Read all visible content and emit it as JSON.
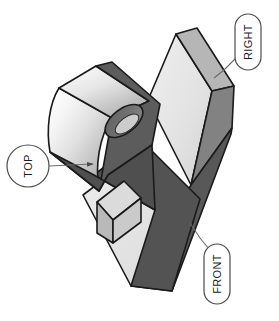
{
  "figure": {
    "type": "technical-illustration",
    "background_color": "#ffffff",
    "outline_color": "#1a1a1a",
    "outline_width": 1.6
  },
  "palette": {
    "face_light": "#e9e9e9",
    "face_light_2": "#dedede",
    "face_mid": "#b4b4b4",
    "face_dark": "#808080",
    "face_darker": "#575757",
    "face_darkest": "#4a4a4a",
    "hole_wall": "#6e6e6e",
    "hole_floor": "#cfcfcf",
    "gradient_high": "#fdfdfd",
    "gradient_low": "#9a9a9a",
    "leader_color": "#6b6b6b",
    "balloon_fill": "#ffffff",
    "balloon_stroke": "#4b4b4b",
    "text_color": "#1a1a1a"
  },
  "callouts": [
    {
      "id": "top",
      "label": "TOP",
      "shape": "circle",
      "rotation_deg": -90,
      "balloon": {
        "cx": 28,
        "cy": 166,
        "r": 21
      },
      "text_pos": {
        "x": 28,
        "y": 166
      },
      "leader": {
        "x1": 49,
        "y1": 166,
        "x2": 95,
        "y2": 164
      },
      "arrowhead": "filled-triangle",
      "arrow_at": "end"
    },
    {
      "id": "right",
      "label": "RIGHT",
      "shape": "pill",
      "rotation_deg": -90,
      "balloon": {
        "x": 235,
        "y": 14,
        "w": 26,
        "h": 56,
        "rx": 13
      },
      "text_pos": {
        "x": 248,
        "y": 42
      },
      "leader": {
        "x1": 237,
        "y1": 55,
        "x2": 216,
        "y2": 76
      },
      "arrowhead": "none",
      "arrow_at": "none"
    },
    {
      "id": "front",
      "label": "FRONT",
      "shape": "pill",
      "rotation_deg": -90,
      "balloon": {
        "x": 204,
        "y": 244,
        "w": 26,
        "h": 60,
        "rx": 13
      },
      "text_pos": {
        "x": 217,
        "y": 274
      },
      "leader": {
        "x1": 208,
        "y1": 250,
        "x2": 190,
        "y2": 224
      },
      "arrowhead": "none",
      "arrow_at": "none"
    }
  ],
  "geometry": {
    "description": "V-shaped bracket in isometric view: an upright right-hand slab, a forward-leaning base wing, and a curved cylindrical lobe pierced by a through hole.",
    "hole": {
      "type": "through-hole",
      "appearance": "ellipse",
      "cx": 124,
      "cy": 121,
      "rx": 22,
      "ry": 12,
      "rotation_deg": -38
    },
    "faces": [
      {
        "name": "right-slab-front-face",
        "shade": "light"
      },
      {
        "name": "right-slab-top-edge",
        "shade": "mid"
      },
      {
        "name": "right-slab-side-face",
        "shade": "dark"
      },
      {
        "name": "base-wing-top-face",
        "shade": "light"
      },
      {
        "name": "base-wing-front-face",
        "shade": "darker"
      },
      {
        "name": "lobe-curved-surface",
        "shade": "gradient"
      },
      {
        "name": "lobe-end-face",
        "shade": "darker"
      },
      {
        "name": "notch-inner-face",
        "shade": "mid"
      }
    ]
  }
}
